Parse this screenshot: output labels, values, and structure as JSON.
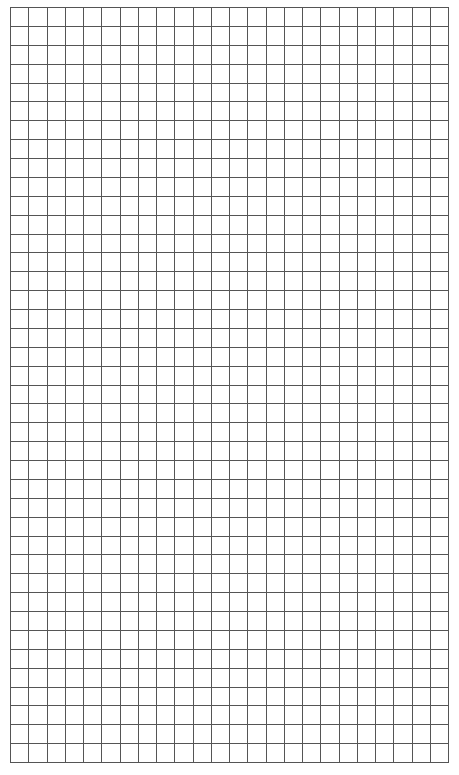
{
  "grid_paper": {
    "columns": 24,
    "rows": 40,
    "line_color": "#555555",
    "background_color": "#ffffff",
    "left": 10,
    "top": 7,
    "width": 439,
    "height": 756
  }
}
